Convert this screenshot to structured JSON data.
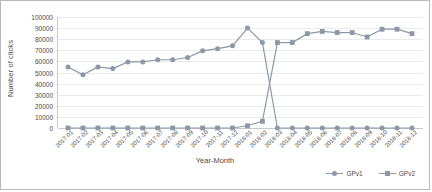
{
  "chart_data": {
    "type": "line",
    "title": "",
    "xlabel": "Year-Month",
    "ylabel": "Number of clicks",
    "ylim": [
      0,
      100000
    ],
    "ytick_step": 10000,
    "yticks": [
      0,
      10000,
      20000,
      30000,
      40000,
      50000,
      60000,
      70000,
      80000,
      90000,
      100000
    ],
    "grid": true,
    "legend_position": "bottom-right",
    "categories": [
      "2017-01",
      "2017-02",
      "2017-03",
      "2017-04",
      "2017-05",
      "2017-06",
      "2017-07",
      "2017-08",
      "2017-09",
      "2017-10",
      "2017-11",
      "2017-12",
      "2018-01",
      "2018-02",
      "2018-03",
      "2018-04",
      "2018-05",
      "2018-06",
      "2018-07",
      "2018-08",
      "2018-09",
      "2018-10",
      "2018-11",
      "2018-12"
    ],
    "series": [
      {
        "name": "GPv1",
        "marker": "circle",
        "color": "#8a98a8",
        "values": [
          55000,
          48000,
          55000,
          53500,
          59500,
          59500,
          61500,
          61500,
          63500,
          69500,
          71500,
          74000,
          90000,
          77000,
          0,
          0,
          0,
          0,
          0,
          0,
          0,
          0,
          0,
          0
        ]
      },
      {
        "name": "GPv2",
        "marker": "square",
        "color": "#8a98a8",
        "values": [
          0,
          0,
          0,
          0,
          0,
          0,
          0,
          0,
          0,
          0,
          0,
          0,
          2000,
          6000,
          77000,
          77000,
          85000,
          87000,
          86000,
          86000,
          82000,
          89000,
          89000,
          85000
        ]
      }
    ]
  },
  "legend": {
    "items": [
      {
        "label": "GPv1"
      },
      {
        "label": "GPv2"
      }
    ]
  }
}
